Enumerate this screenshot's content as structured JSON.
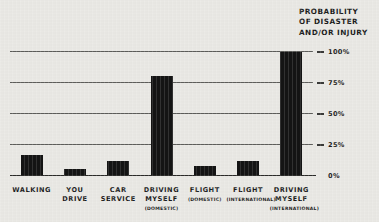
{
  "chart_data": {
    "type": "bar",
    "title": "PROBABILITY OF DISASTER AND/OR INJURY",
    "title_lines": [
      "PROBABILITY",
      "OF DISASTER",
      "AND/OR INJURY"
    ],
    "xlabel": "",
    "ylabel": "PROBABILITY OF DISASTER AND/OR INJURY",
    "ylim": [
      0,
      100
    ],
    "yticks": [
      0,
      25,
      50,
      75,
      100
    ],
    "ytick_labels": [
      "0%",
      "25%",
      "50%",
      "75%",
      "100%"
    ],
    "grid": true,
    "legend": "none",
    "categories": [
      "WALKING",
      "YOU DRIVE",
      "CAR SERVICE",
      "DRIVING MYSELF (DOMESTIC)",
      "FLIGHT (DOMESTIC)",
      "FLIGHT (INTERNATIONAL)",
      "DRIVING MYSELF (INTERNATIONAL)"
    ],
    "values": [
      17,
      6,
      12,
      81,
      8,
      12,
      100
    ],
    "bars": [
      {
        "label_lines": [
          "WALKING"
        ],
        "sub": "",
        "value": 17
      },
      {
        "label_lines": [
          "YOU",
          "DRIVE"
        ],
        "sub": "",
        "value": 6
      },
      {
        "label_lines": [
          "CAR",
          "SERVICE"
        ],
        "sub": "",
        "value": 12
      },
      {
        "label_lines": [
          "DRIVING",
          "MYSELF"
        ],
        "sub": "(DOMESTIC)",
        "value": 81
      },
      {
        "label_lines": [
          "FLIGHT"
        ],
        "sub": "(DOMESTIC)",
        "value": 8
      },
      {
        "label_lines": [
          "FLIGHT"
        ],
        "sub": "(INTERNATIONAL)",
        "value": 12
      },
      {
        "label_lines": [
          "DRIVING",
          "MYSELF"
        ],
        "sub": "(INTERNATIONAL)",
        "value": 100
      }
    ]
  },
  "colors": {
    "background": "#e9e8e4",
    "bar": "#141414",
    "gridline": "#5d5d5a",
    "baseline": "#2a2a28",
    "text": "#1c1c1c"
  }
}
